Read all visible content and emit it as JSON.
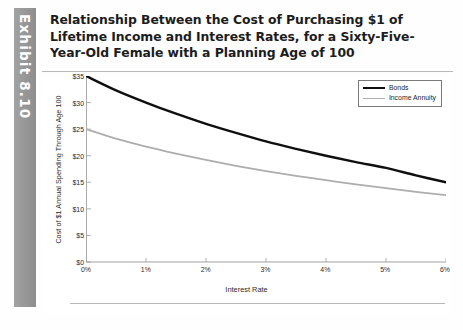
{
  "exhibit": {
    "label": "Exhibit 8.10",
    "band_color": "#9b9b9b"
  },
  "header": {
    "title": "Relationship Between the Cost of Purchasing $1 of Lifetime Income and Interest Rates, for a Sixty-Five-Year-Old Female with a Planning Age of 100"
  },
  "chart_data": {
    "type": "line",
    "title": "",
    "xlabel": "Interest Rate",
    "ylabel": "Cost of $1 Annual Spending Through Age 100",
    "x": [
      0,
      0.5,
      1,
      1.5,
      2,
      2.5,
      3,
      3.5,
      4,
      4.5,
      5,
      5.5,
      6
    ],
    "xtick_labels": [
      "0%",
      "1%",
      "2%",
      "3%",
      "4%",
      "5%",
      "6%"
    ],
    "xtick_values": [
      0,
      1,
      2,
      3,
      4,
      5,
      6
    ],
    "xlim": [
      0,
      6
    ],
    "ytick_labels": [
      "$0",
      "$5",
      "$10",
      "$15",
      "$20",
      "$25",
      "$30",
      "$35"
    ],
    "ytick_values": [
      0,
      5,
      10,
      15,
      20,
      25,
      30,
      35
    ],
    "ylim": [
      0,
      35
    ],
    "grid": false,
    "legend_position": "top-right",
    "series": [
      {
        "name": "Bonds",
        "color": "#0f0f0f",
        "width": 2.4,
        "values": [
          35.0,
          32.3,
          30.0,
          27.9,
          26.0,
          24.3,
          22.7,
          21.3,
          20.0,
          18.8,
          17.7,
          16.3,
          15.0
        ]
      },
      {
        "name": "Income Annuity",
        "color": "#adadad",
        "width": 1.8,
        "values": [
          25.0,
          23.2,
          21.7,
          20.4,
          19.2,
          18.1,
          17.1,
          16.2,
          15.4,
          14.6,
          13.9,
          13.2,
          12.6
        ]
      }
    ]
  },
  "legend": {
    "items": [
      {
        "label": "Bonds"
      },
      {
        "label": "Income Annuity"
      }
    ]
  }
}
